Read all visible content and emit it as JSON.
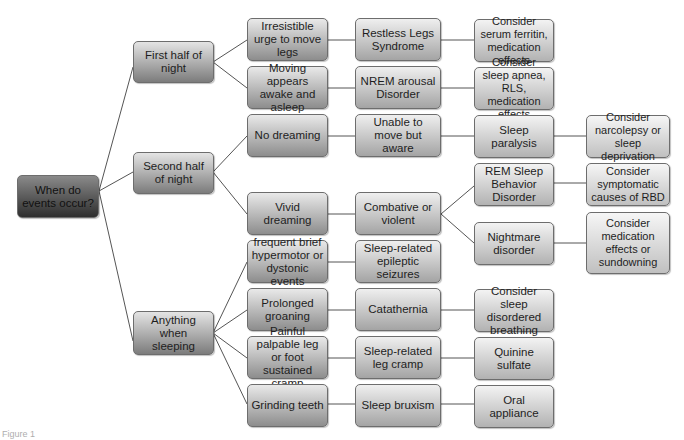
{
  "root": {
    "label": "When do events occur?"
  },
  "level1": [
    {
      "label": "First half of night"
    },
    {
      "label": "Second half of night"
    },
    {
      "label": "Anything when sleeping"
    }
  ],
  "level2": [
    {
      "label": "Irresistible urge to move legs"
    },
    {
      "label": "Moving appears awake and asleep"
    },
    {
      "label": "No dreaming"
    },
    {
      "label": "Vivid dreaming"
    },
    {
      "label": "frequent brief hypermotor or dystonic events"
    },
    {
      "label": "Prolonged groaning"
    },
    {
      "label": "Painful palpable leg or foot sustained cramp"
    },
    {
      "label": "Grinding teeth"
    }
  ],
  "level3": [
    {
      "label": "Restless Legs Syndrome"
    },
    {
      "label": "NREM arousal Disorder"
    },
    {
      "label": "Unable to move but aware"
    },
    {
      "label": "Combative or violent"
    },
    {
      "label": "Sleep-related epileptic seizures"
    },
    {
      "label": "Catathernia"
    },
    {
      "label": "Sleep-related leg cramp"
    },
    {
      "label": "Sleep bruxism"
    }
  ],
  "level4": [
    {
      "label": "Consider serum ferritin, medication effects"
    },
    {
      "label": "Consider sleep apnea, RLS, medication effects"
    },
    {
      "label": "Sleep paralysis"
    },
    {
      "label": "REM Sleep Behavior Disorder"
    },
    {
      "label": "Nightmare disorder"
    },
    {
      "label": "Consider sleep disordered breathing"
    },
    {
      "label": "Quinine sulfate"
    },
    {
      "label": "Oral appliance"
    }
  ],
  "level5": [
    {
      "label": "Consider narcolepsy or sleep deprivation"
    },
    {
      "label": "Consider symptomatic causes of RBD"
    },
    {
      "label": "Consider medication effects or sundowning"
    }
  ],
  "caption": {
    "text": "Figure 1"
  }
}
